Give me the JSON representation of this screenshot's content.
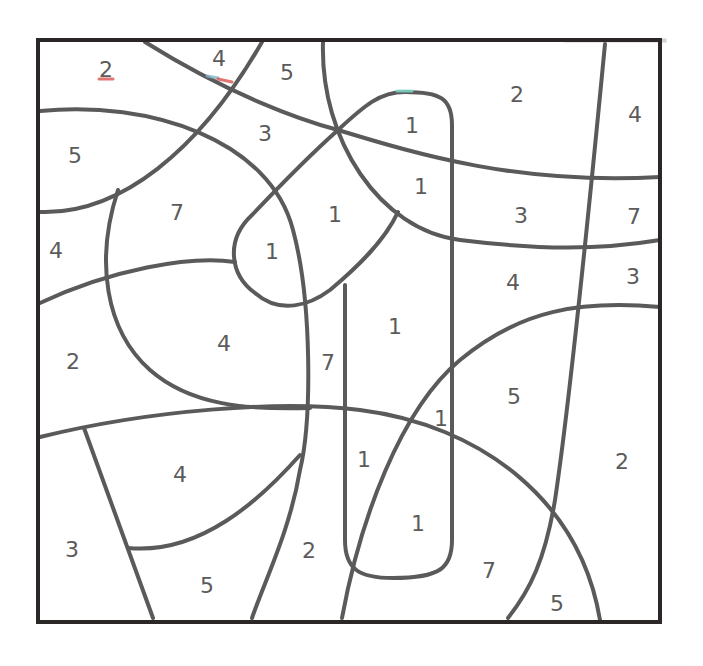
{
  "puzzle": {
    "type": "color-by-number",
    "frame": {
      "x": 38,
      "y": 40,
      "width": 622,
      "height": 582
    },
    "line_color": "#5a5a5a",
    "frame_color": "#2b2727",
    "text_color": "#5b5b5b",
    "paths": [
      {
        "id": "diag-top-left-to-right",
        "d": "M 145 42 C 230 95, 300 120, 338 130 C 420 155, 520 185, 660 177"
      },
      {
        "id": "arc-top-left-rising",
        "d": "M 40 212 C 120 215, 200 150, 262 42"
      },
      {
        "id": "arc-upper-left-sweep",
        "d": "M 40 111 C 150 100, 270 140, 293 230 C 312 300, 312 420, 300 470 C 290 530, 265 580, 252 618"
      },
      {
        "id": "arc-top-center-down",
        "d": "M 323 42 C 320 140, 380 230, 460 240 C 540 250, 600 250, 660 240"
      },
      {
        "id": "line-337-to-lobe",
        "d": "M 338 130 C 310 155, 290 175, 252 215 C 225 240, 230 275, 255 293 C 280 315, 310 305, 330 290 C 360 265, 385 240, 398 212"
      },
      {
        "id": "line-left-mid",
        "d": "M 40 303 C 110 270, 190 255, 235 262"
      },
      {
        "id": "arc-left-lobe",
        "d": "M 118 190 C 95 260, 105 330, 150 370 C 190 405, 245 410, 310 408"
      },
      {
        "id": "arc-lower-big",
        "d": "M 40 437 C 150 410, 280 400, 360 410 C 480 425, 580 500, 600 620"
      },
      {
        "id": "line-lower-left-slant",
        "d": "M 84 428 L 153 618"
      },
      {
        "id": "arc-lower-left-curve",
        "d": "M 128 548 C 200 555, 260 500, 300 455"
      },
      {
        "id": "capsule-tall",
        "d": "M 345 285 L 345 540 C 345 570, 360 578, 393 578 C 440 578, 452 568, 452 540 L 452 125 C 452 98, 440 92, 405 92 C 380 92, 365 105, 338 130"
      },
      {
        "id": "arc-lower-right-sweep",
        "d": "M 342 618 C 360 520, 400 410, 460 360 C 520 310, 580 300, 660 307"
      },
      {
        "id": "line-right-vertical",
        "d": "M 605 44 C 590 200, 570 400, 555 500 C 545 560, 530 590, 508 618"
      }
    ],
    "labels": [
      {
        "value": "2",
        "x": 106,
        "y": 69
      },
      {
        "value": "4",
        "x": 219,
        "y": 58
      },
      {
        "value": "5",
        "x": 287,
        "y": 72
      },
      {
        "value": "2",
        "x": 517,
        "y": 94
      },
      {
        "value": "4",
        "x": 635,
        "y": 114
      },
      {
        "value": "5",
        "x": 75,
        "y": 155
      },
      {
        "value": "3",
        "x": 265,
        "y": 133
      },
      {
        "value": "1",
        "x": 412,
        "y": 125
      },
      {
        "value": "1",
        "x": 421,
        "y": 186
      },
      {
        "value": "7",
        "x": 177,
        "y": 212
      },
      {
        "value": "1",
        "x": 335,
        "y": 214
      },
      {
        "value": "3",
        "x": 521,
        "y": 215
      },
      {
        "value": "7",
        "x": 634,
        "y": 216
      },
      {
        "value": "4",
        "x": 56,
        "y": 250
      },
      {
        "value": "1",
        "x": 272,
        "y": 251
      },
      {
        "value": "4",
        "x": 513,
        "y": 282
      },
      {
        "value": "3",
        "x": 633,
        "y": 276
      },
      {
        "value": "1",
        "x": 395,
        "y": 326
      },
      {
        "value": "4",
        "x": 224,
        "y": 343
      },
      {
        "value": "2",
        "x": 73,
        "y": 361
      },
      {
        "value": "7",
        "x": 328,
        "y": 362
      },
      {
        "value": "5",
        "x": 514,
        "y": 396
      },
      {
        "value": "1",
        "x": 441,
        "y": 418
      },
      {
        "value": "1",
        "x": 364,
        "y": 459
      },
      {
        "value": "2",
        "x": 622,
        "y": 461
      },
      {
        "value": "4",
        "x": 180,
        "y": 474
      },
      {
        "value": "1",
        "x": 418,
        "y": 523
      },
      {
        "value": "3",
        "x": 72,
        "y": 549
      },
      {
        "value": "2",
        "x": 309,
        "y": 550
      },
      {
        "value": "7",
        "x": 489,
        "y": 570
      },
      {
        "value": "5",
        "x": 207,
        "y": 585
      },
      {
        "value": "5",
        "x": 557,
        "y": 603
      }
    ],
    "marks": [
      {
        "color": "#d9534f",
        "d": "M 99 79 L 113 79"
      },
      {
        "color": "#7fb3c8",
        "d": "M 207 76 L 218 78"
      },
      {
        "color": "#d9534f",
        "d": "M 218 79 L 232 82"
      },
      {
        "color": "#7fdcd0",
        "d": "M 397 91 L 412 91"
      }
    ]
  }
}
